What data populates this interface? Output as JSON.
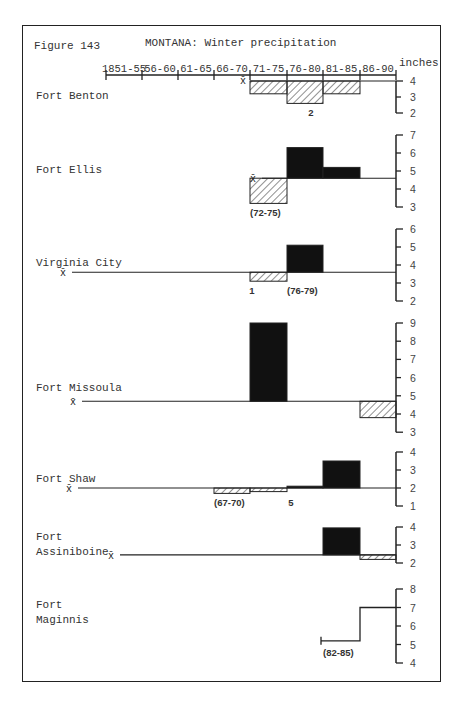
{
  "header": {
    "figure_number": "Figure 143",
    "title": "MONTANA:  Winter precipitation",
    "units": "inches"
  },
  "chart_data": {
    "type": "bar",
    "title": "MONTANA: Winter precipitation",
    "xlabel": "Period",
    "ylabel": "inches",
    "categories": [
      "1851-55",
      "56-60",
      "61-65",
      "66-70",
      "71-75",
      "76-80",
      "81-85",
      "86-90"
    ],
    "note": "Bars show 5-year mean departures from the station mean (x̄); solid = above mean, hatched = below mean.",
    "stations": [
      {
        "name": "Fort Benton",
        "mean": 4.0,
        "yticks": [
          4,
          3,
          2
        ],
        "ylim": [
          2,
          4
        ],
        "values": {
          "71-75": 3.2,
          "76-80": 2.6,
          "81-85": 3.2
        },
        "annotations": [
          {
            "text": "2",
            "period": "76-80"
          }
        ]
      },
      {
        "name": "Fort Ellis",
        "mean": 4.6,
        "yticks": [
          7,
          6,
          5,
          4,
          3
        ],
        "ylim": [
          3,
          7
        ],
        "values": {
          "71-75": 3.2,
          "76-80": 6.3,
          "81-85": 5.2
        },
        "annotations": [
          {
            "text": "(72-75)",
            "period": "71-75"
          }
        ]
      },
      {
        "name": "Virginia City",
        "mean": 3.6,
        "yticks": [
          6,
          5,
          4,
          3,
          2
        ],
        "ylim": [
          2,
          6
        ],
        "values": {
          "71-75": 3.1,
          "76-80": 5.1
        },
        "annotations": [
          {
            "text": "1",
            "period": "71-75"
          },
          {
            "text": "(76-79)",
            "period": "76-80"
          }
        ]
      },
      {
        "name": "Fort Missoula",
        "mean": 4.7,
        "yticks": [
          9,
          8,
          7,
          6,
          5,
          4,
          3
        ],
        "ylim": [
          3,
          9
        ],
        "values": {
          "71-75": 9.0,
          "86-90": 3.8
        }
      },
      {
        "name": "Fort Shaw",
        "mean": 2.0,
        "yticks": [
          4,
          3,
          2,
          1
        ],
        "ylim": [
          1,
          4
        ],
        "values": {
          "66-70": 1.7,
          "71-75": 1.8,
          "76-80": 2.1,
          "81-85": 3.5
        },
        "annotations": [
          {
            "text": "(67-70)",
            "period": "66-70"
          },
          {
            "text": "5",
            "period": "76-80"
          }
        ]
      },
      {
        "name": "Fort Assiniboine",
        "mean": 2.45,
        "yticks": [
          4,
          3,
          2
        ],
        "ylim": [
          2,
          4
        ],
        "values": {
          "81-85": 3.95,
          "86-90": 2.2
        }
      },
      {
        "name": "Fort Maginnis",
        "mean": null,
        "yticks": [
          8,
          7,
          6,
          5,
          4
        ],
        "ylim": [
          4,
          8
        ],
        "values": {
          "81-85": 5.2,
          "86-90": 7.0
        },
        "annotations": [
          {
            "text": "(82-85)",
            "period": "81-85"
          }
        ]
      }
    ]
  },
  "stations": {
    "benton": {
      "name": "Fort Benton"
    },
    "ellis": {
      "name": "Fort Ellis"
    },
    "virginia": {
      "name": "Virginia City"
    },
    "missoula": {
      "name": "Fort Missoula"
    },
    "shaw": {
      "name": "Fort Shaw"
    },
    "assiniboine": {
      "line1": "Fort",
      "line2": "Assiniboine"
    },
    "maginnis": {
      "line1": "Fort",
      "line2": "Maginnis"
    }
  },
  "mean_symbol": "x̄"
}
